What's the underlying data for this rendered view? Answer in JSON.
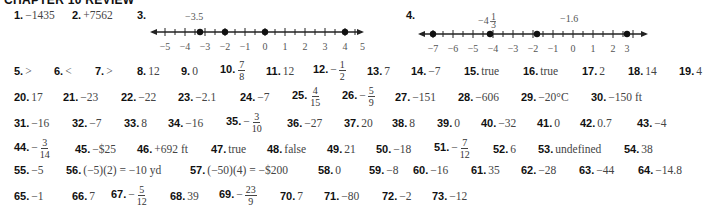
{
  "header": {
    "title": "CHAPTER 10 REVIEW"
  },
  "number_lines": [
    {
      "num": "3.",
      "labels": [
        "-3.5"
      ],
      "ticks": [
        "−5",
        "−4",
        "−3",
        "−2",
        "−1",
        "0",
        "1",
        "2",
        "3",
        "4",
        "5"
      ],
      "points": [
        -3.5,
        -2,
        0,
        4
      ]
    },
    {
      "num": "4.",
      "labels": [
        "−4⅓",
        "−1.6"
      ],
      "ticks": [
        "−7",
        "−6",
        "−5",
        "−4",
        "−3",
        "−2",
        "−1",
        "0",
        "1",
        "2",
        "3"
      ],
      "points": [
        -7,
        -4.333,
        -1.6,
        3
      ]
    }
  ],
  "answers": {
    "a1": {
      "num": "1.",
      "val": "−1435"
    },
    "a2": {
      "num": "2.",
      "val": "+7562"
    },
    "a5": {
      "num": "5.",
      "val": ">"
    },
    "a6": {
      "num": "6.",
      "val": "<"
    },
    "a7": {
      "num": "7.",
      "val": ">"
    },
    "a8": {
      "num": "8.",
      "val": "12"
    },
    "a9": {
      "num": "9.",
      "val": "0"
    },
    "a10": {
      "num": "10.",
      "sign": "",
      "n": "7",
      "d": "8"
    },
    "a11": {
      "num": "11.",
      "val": "12"
    },
    "a12": {
      "num": "12.",
      "sign": "−",
      "n": "1",
      "d": "2"
    },
    "a13": {
      "num": "13.",
      "val": "7"
    },
    "a14": {
      "num": "14.",
      "val": "−7"
    },
    "a15": {
      "num": "15.",
      "val": "true"
    },
    "a16": {
      "num": "16.",
      "val": "true"
    },
    "a17": {
      "num": "17.",
      "val": "2"
    },
    "a18": {
      "num": "18.",
      "val": "14"
    },
    "a19": {
      "num": "19.",
      "val": "4"
    },
    "a20": {
      "num": "20.",
      "val": "17"
    },
    "a21": {
      "num": "21.",
      "val": "−23"
    },
    "a22": {
      "num": "22.",
      "val": "−22"
    },
    "a23": {
      "num": "23.",
      "val": "−2.1"
    },
    "a24": {
      "num": "24.",
      "val": "−7"
    },
    "a25": {
      "num": "25.",
      "sign": "",
      "n": "4",
      "d": "15"
    },
    "a26": {
      "num": "26.",
      "sign": "−",
      "n": "5",
      "d": "9"
    },
    "a27": {
      "num": "27.",
      "val": "−151"
    },
    "a28": {
      "num": "28.",
      "val": "−606"
    },
    "a29": {
      "num": "29.",
      "val": "−20°C"
    },
    "a30": {
      "num": "30.",
      "val": "−150 ft"
    },
    "a31": {
      "num": "31.",
      "val": "−16"
    },
    "a32": {
      "num": "32.",
      "val": "−7"
    },
    "a33": {
      "num": "33.",
      "val": "8"
    },
    "a34": {
      "num": "34.",
      "val": "−16"
    },
    "a35": {
      "num": "35.",
      "sign": "−",
      "n": "3",
      "d": "10"
    },
    "a36": {
      "num": "36.",
      "val": "−27"
    },
    "a37": {
      "num": "37.",
      "val": "20"
    },
    "a38": {
      "num": "38.",
      "val": "8"
    },
    "a39": {
      "num": "39.",
      "val": "0"
    },
    "a40": {
      "num": "40.",
      "val": "−32"
    },
    "a41": {
      "num": "41.",
      "val": "0"
    },
    "a42": {
      "num": "42.",
      "val": "0.7"
    },
    "a43": {
      "num": "43.",
      "val": "−4"
    },
    "a44": {
      "num": "44.",
      "sign": "−",
      "n": "3",
      "d": "14"
    },
    "a45": {
      "num": "45.",
      "val": "−$25"
    },
    "a46": {
      "num": "46.",
      "val": "+692 ft"
    },
    "a47": {
      "num": "47.",
      "val": "true"
    },
    "a48": {
      "num": "48.",
      "val": "false"
    },
    "a49": {
      "num": "49.",
      "val": "21"
    },
    "a50": {
      "num": "50.",
      "val": "−18"
    },
    "a51": {
      "num": "51.",
      "sign": "−",
      "n": "7",
      "d": "12"
    },
    "a52": {
      "num": "52.",
      "val": "6"
    },
    "a53": {
      "num": "53.",
      "val": "undefined"
    },
    "a54": {
      "num": "54.",
      "val": "38"
    },
    "a55": {
      "num": "55.",
      "val": "−5"
    },
    "a56": {
      "num": "56.",
      "val": "(−5)(2) = −10 yd"
    },
    "a57": {
      "num": "57.",
      "val": "(−50)(4) = −$200"
    },
    "a58": {
      "num": "58.",
      "val": "0"
    },
    "a59": {
      "num": "59.",
      "val": "−8"
    },
    "a60": {
      "num": "60.",
      "val": "−16"
    },
    "a61": {
      "num": "61.",
      "val": "35"
    },
    "a62": {
      "num": "62.",
      "val": "−28"
    },
    "a63": {
      "num": "63.",
      "val": "−44"
    },
    "a64": {
      "num": "64.",
      "val": "−14.8"
    },
    "a65": {
      "num": "65.",
      "val": "−1"
    },
    "a66": {
      "num": "66.",
      "val": "7"
    },
    "a67": {
      "num": "67.",
      "sign": "−",
      "n": "5",
      "d": "12"
    },
    "a68": {
      "num": "68.",
      "val": "39"
    },
    "a69": {
      "num": "69.",
      "sign": "−",
      "n": "23",
      "d": "9"
    },
    "a70": {
      "num": "70.",
      "val": "7"
    },
    "a71": {
      "num": "71.",
      "val": "−80"
    },
    "a72": {
      "num": "72.",
      "val": "−2"
    },
    "a73": {
      "num": "73.",
      "val": "−12"
    }
  }
}
